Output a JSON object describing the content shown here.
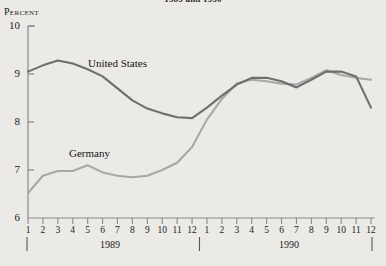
{
  "chart": {
    "title": "1989 and 1990",
    "y_axis_unit": "Percent",
    "series_label_us": "United States",
    "series_label_germany": "Germany",
    "year_left": "1989",
    "year_right": "1990",
    "color_us": "#6e6e6e",
    "color_germany": "#a8a8a8",
    "axis_color": "#8a8a8a",
    "background": "#eceae6"
  },
  "chart_data": {
    "type": "line",
    "title": "1989 and 1990",
    "xlabel": "",
    "ylabel": "Percent",
    "ylim": [
      6,
      10
    ],
    "yticks": [
      6,
      7,
      8,
      9,
      10
    ],
    "ytick_labels": [
      "6",
      "7",
      "8",
      "9",
      "10"
    ],
    "grid": false,
    "legend": "inline-annotation",
    "x": [
      "1989-1",
      "1989-2",
      "1989-3",
      "1989-4",
      "1989-5",
      "1989-6",
      "1989-7",
      "1989-8",
      "1989-9",
      "1989-10",
      "1989-11",
      "1989-12",
      "1990-1",
      "1990-2",
      "1990-3",
      "1990-4",
      "1990-5",
      "1990-6",
      "1990-7",
      "1990-8",
      "1990-9",
      "1990-10",
      "1990-11",
      "1990-12"
    ],
    "xtick_labels": [
      "1",
      "2",
      "3",
      "4",
      "5",
      "6",
      "7",
      "8",
      "9",
      "10",
      "11",
      "12",
      "1",
      "2",
      "3",
      "4",
      "5",
      "6",
      "7",
      "8",
      "9",
      "10",
      "11",
      "12"
    ],
    "x_group_labels": [
      "1989",
      "1990"
    ],
    "series": [
      {
        "name": "United States",
        "color": "#6e6e6e",
        "values": [
          9.05,
          9.18,
          9.28,
          9.22,
          9.1,
          8.95,
          8.7,
          8.45,
          8.28,
          8.18,
          8.1,
          8.08,
          8.3,
          8.55,
          8.78,
          8.92,
          8.92,
          8.85,
          8.72,
          8.88,
          9.05,
          9.05,
          8.95,
          8.3
        ]
      },
      {
        "name": "Germany",
        "color": "#a8a8a8",
        "values": [
          6.52,
          6.88,
          6.98,
          6.98,
          7.1,
          6.95,
          6.88,
          6.85,
          6.88,
          7.0,
          7.15,
          7.48,
          8.05,
          8.48,
          8.8,
          8.88,
          8.85,
          8.8,
          8.78,
          8.92,
          9.08,
          8.98,
          8.92,
          8.88
        ]
      }
    ]
  }
}
